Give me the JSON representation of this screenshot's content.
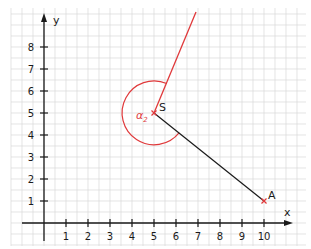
{
  "diagram": {
    "type": "coordinate-geometry",
    "axes": {
      "x_label": "x",
      "y_label": "y",
      "x_ticks": [
        "1",
        "2",
        "3",
        "4",
        "5",
        "6",
        "7",
        "8",
        "9",
        "10"
      ],
      "y_ticks": [
        "1",
        "2",
        "3",
        "4",
        "5",
        "6",
        "7",
        "8"
      ]
    },
    "points": [
      {
        "name": "S",
        "x": 5,
        "y": 5,
        "color": "#e0393b"
      },
      {
        "name": "A",
        "x": 10,
        "y": 1,
        "color": "#e0393b"
      }
    ],
    "segments": [
      {
        "from": "S",
        "to": "A",
        "color": "#1a1a1a"
      }
    ],
    "rays": [
      {
        "from": "S",
        "through": [
          6.9,
          9.6
        ],
        "color": "#e0393b"
      }
    ],
    "angle": {
      "label": "α",
      "subscript": "2",
      "vertex": "S",
      "color": "#e0393b"
    },
    "colors": {
      "grid": "#d9d9d9",
      "axis": "#1a1a1a",
      "accent": "#e0393b"
    }
  }
}
